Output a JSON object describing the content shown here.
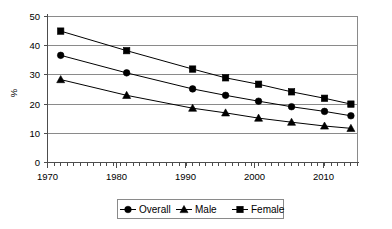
{
  "chart_data": {
    "type": "line",
    "title": "",
    "xlabel": "",
    "ylabel": "%",
    "x": [
      1970,
      1980,
      1990,
      1995,
      2000,
      2005,
      2010,
      2014
    ],
    "xlim": [
      1968,
      2015
    ],
    "ylim": [
      0,
      50
    ],
    "ytick_labels": [
      "0",
      "10",
      "20",
      "30",
      "40",
      "50"
    ],
    "ytick_values": [
      0,
      10,
      20,
      30,
      40,
      50
    ],
    "xtick_labels": [
      "1970",
      "1980",
      "1990",
      "2000",
      "2010"
    ],
    "xtick_values": [
      1970,
      1980,
      1990,
      2000,
      2010
    ],
    "minor_tick_interval": 1,
    "grid": "horizontal",
    "legend_position": "bottom",
    "series": [
      {
        "name": "Overall",
        "marker": "circle",
        "color": "#000000",
        "values": [
          36.7,
          30.7,
          25.2,
          23.0,
          21.0,
          19.1,
          17.5,
          16.0
        ]
      },
      {
        "name": "Male",
        "marker": "triangle",
        "color": "#000000",
        "values": [
          28.4,
          23.0,
          18.6,
          17.0,
          15.2,
          13.8,
          12.5,
          11.7
        ]
      },
      {
        "name": "Female",
        "marker": "square",
        "color": "#000000",
        "values": [
          45.0,
          38.3,
          32.0,
          29.0,
          26.8,
          24.2,
          22.0,
          20.0
        ]
      }
    ]
  },
  "axes": {
    "y_axis_title": "%",
    "y_labels": [
      "50",
      "40",
      "30",
      "20",
      "10",
      "0"
    ],
    "x_labels": [
      "1970",
      "1980",
      "1990",
      "2000",
      "2010"
    ]
  },
  "legend": {
    "entries": [
      {
        "label": "Overall",
        "marker": "circle-marker-icon"
      },
      {
        "label": "Male",
        "marker": "triangle-marker-icon"
      },
      {
        "label": "Female",
        "marker": "square-marker-icon"
      }
    ]
  },
  "colors": {
    "ink": "#000000",
    "gridline": "#8a8a8a",
    "border": "#8a8a8a",
    "axis": "#4d4d4d",
    "background": "#ffffff"
  }
}
